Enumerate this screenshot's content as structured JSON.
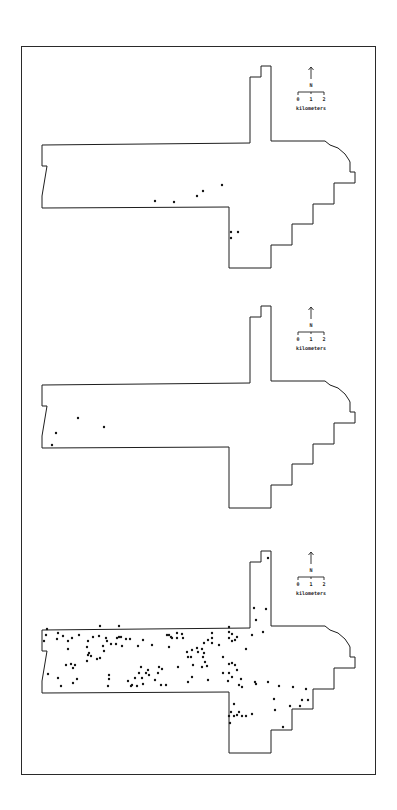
{
  "figure": {
    "panel_count": 3,
    "frame": {
      "x": 21,
      "y": 46,
      "width": 355,
      "height": 729,
      "stroke": "#2a2a2a"
    },
    "ink_color": "#1e1e1e",
    "background": "#ffffff"
  },
  "legend": {
    "north_label": "N",
    "scale_ticks": [
      "0",
      "1",
      "2"
    ],
    "scale_unit": "kilometers"
  },
  "boundary_outline": {
    "description": "Cross-shaped study area with northern arm, eastern curved edge and stepped southern border",
    "points": [
      [
        42,
        145
      ],
      [
        250,
        143
      ],
      [
        250,
        77
      ],
      [
        261,
        77
      ],
      [
        261,
        66
      ],
      [
        271,
        66
      ],
      [
        271,
        141
      ],
      [
        325,
        141
      ],
      [
        330,
        145
      ],
      [
        338,
        148
      ],
      [
        345,
        154
      ],
      [
        349,
        160
      ],
      [
        350,
        162
      ],
      [
        350,
        172
      ],
      [
        355,
        172
      ],
      [
        355,
        183
      ],
      [
        334,
        183
      ],
      [
        334,
        204
      ],
      [
        313,
        204
      ],
      [
        313,
        224
      ],
      [
        292,
        224
      ],
      [
        292,
        245
      ],
      [
        271,
        245
      ],
      [
        271,
        268
      ],
      [
        229,
        268
      ],
      [
        229,
        207
      ],
      [
        42,
        208
      ],
      [
        42,
        196
      ],
      [
        47,
        166
      ],
      [
        42,
        166
      ]
    ]
  },
  "panels": [
    {
      "id": "panel-1",
      "offset_y": 0,
      "legend_pos": {
        "x": 311,
        "y": 67
      },
      "dots": [
        [
          155,
          201
        ],
        [
          174,
          202
        ],
        [
          197,
          196
        ],
        [
          203,
          191
        ],
        [
          222,
          185
        ],
        [
          231,
          232
        ],
        [
          238,
          232
        ],
        [
          231,
          238
        ]
      ]
    },
    {
      "id": "panel-2",
      "offset_y": 240,
      "legend_pos": {
        "x": 311,
        "y": 307
      },
      "dots": [
        [
          78,
          418
        ],
        [
          104,
          427
        ],
        [
          56,
          433
        ],
        [
          52,
          445
        ]
      ]
    },
    {
      "id": "panel-3",
      "offset_y": 485,
      "legend_pos": {
        "x": 311,
        "y": 552
      },
      "dots": [
        [
          268,
          558
        ],
        [
          254,
          608
        ],
        [
          266,
          609
        ],
        [
          256,
          620
        ],
        [
          252,
          635
        ],
        [
          263,
          632
        ],
        [
          246,
          649
        ],
        [
          47,
          629
        ],
        [
          46,
          635
        ],
        [
          44,
          641
        ],
        [
          58,
          633
        ],
        [
          57,
          639
        ],
        [
          63,
          636
        ],
        [
          68,
          641
        ],
        [
          72,
          638
        ],
        [
          79,
          635
        ],
        [
          68,
          649
        ],
        [
          88,
          641
        ],
        [
          93,
          637
        ],
        [
          99,
          636
        ],
        [
          100,
          626
        ],
        [
          106,
          638
        ],
        [
          107,
          641
        ],
        [
          103,
          646
        ],
        [
          104,
          651
        ],
        [
          111,
          644
        ],
        [
          116,
          644
        ],
        [
          117,
          638
        ],
        [
          119,
          637
        ],
        [
          121,
          637
        ],
        [
          119,
          626
        ],
        [
          122,
          646
        ],
        [
          126,
          639
        ],
        [
          130,
          639
        ],
        [
          138,
          646
        ],
        [
          143,
          640
        ],
        [
          152,
          645
        ],
        [
          87,
          647
        ],
        [
          89,
          653
        ],
        [
          91,
          656
        ],
        [
          88,
          655
        ],
        [
          97,
          659
        ],
        [
          100,
          658
        ],
        [
          87,
          661
        ],
        [
          66,
          665
        ],
        [
          71,
          664
        ],
        [
          75,
          665
        ],
        [
          73,
          668
        ],
        [
          48,
          674
        ],
        [
          58,
          678
        ],
        [
          77,
          679
        ],
        [
          73,
          683
        ],
        [
          61,
          686
        ],
        [
          109,
          675
        ],
        [
          109,
          679
        ],
        [
          108,
          686
        ],
        [
          128,
          681
        ],
        [
          131,
          686
        ],
        [
          132,
          685
        ],
        [
          135,
          678
        ],
        [
          137,
          686
        ],
        [
          139,
          673
        ],
        [
          141,
          667
        ],
        [
          142,
          678
        ],
        [
          143,
          684
        ],
        [
          146,
          673
        ],
        [
          148,
          670
        ],
        [
          149,
          675
        ],
        [
          155,
          680
        ],
        [
          158,
          673
        ],
        [
          159,
          667
        ],
        [
          162,
          669
        ],
        [
          161,
          685
        ],
        [
          166,
          685
        ],
        [
          167,
          635
        ],
        [
          169,
          635
        ],
        [
          171,
          637
        ],
        [
          169,
          647
        ],
        [
          172,
          638
        ],
        [
          177,
          633
        ],
        [
          177,
          638
        ],
        [
          182,
          634
        ],
        [
          183,
          638
        ],
        [
          187,
          652
        ],
        [
          188,
          657
        ],
        [
          191,
          657
        ],
        [
          192,
          650
        ],
        [
          197,
          648
        ],
        [
          198,
          652
        ],
        [
          202,
          649
        ],
        [
          204,
          653
        ],
        [
          203,
          657
        ],
        [
          205,
          662
        ],
        [
          193,
          665
        ],
        [
          192,
          677
        ],
        [
          188,
          682
        ],
        [
          178,
          667
        ],
        [
          202,
          667
        ],
        [
          207,
          666
        ],
        [
          204,
          643
        ],
        [
          208,
          640
        ],
        [
          212,
          638
        ],
        [
          212,
          633
        ],
        [
          212,
          643
        ],
        [
          219,
          645
        ],
        [
          229,
          627
        ],
        [
          229,
          632
        ],
        [
          232,
          634
        ],
        [
          237,
          637
        ],
        [
          235,
          640
        ],
        [
          232,
          641
        ],
        [
          229,
          638
        ],
        [
          223,
          657
        ],
        [
          229,
          664
        ],
        [
          232,
          663
        ],
        [
          235,
          665
        ],
        [
          237,
          670
        ],
        [
          223,
          673
        ],
        [
          229,
          673
        ],
        [
          232,
          677
        ],
        [
          228,
          681
        ],
        [
          241,
          679
        ],
        [
          239,
          685
        ],
        [
          242,
          687
        ],
        [
          255,
          682
        ],
        [
          256,
          684
        ],
        [
          268,
          682
        ],
        [
          208,
          680
        ],
        [
          279,
          686
        ],
        [
          293,
          687
        ],
        [
          306,
          689
        ],
        [
          274,
          699
        ],
        [
          275,
          710
        ],
        [
          302,
          700
        ],
        [
          308,
          700
        ],
        [
          290,
          706
        ],
        [
          300,
          706
        ],
        [
          283,
          727
        ],
        [
          234,
          704
        ],
        [
          231,
          712
        ],
        [
          229,
          716
        ],
        [
          239,
          712
        ],
        [
          237,
          715
        ],
        [
          234,
          716
        ],
        [
          246,
          716
        ],
        [
          252,
          714
        ],
        [
          230,
          723
        ],
        [
          242,
          716
        ]
      ]
    }
  ]
}
